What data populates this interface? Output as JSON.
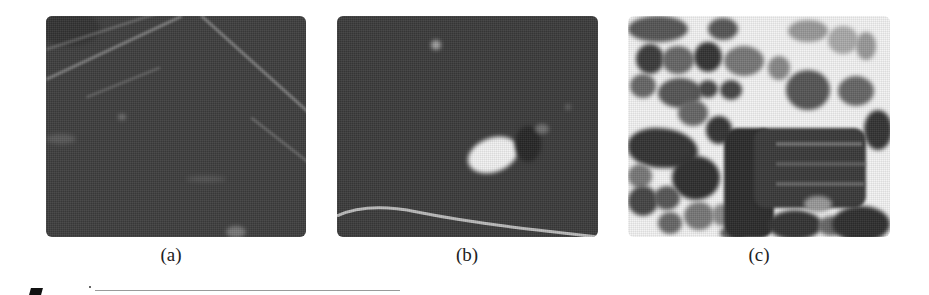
{
  "figure": {
    "panels": [
      {
        "id": "a",
        "caption": "(a)",
        "description": "Dark grayscale image with faint diagonal light streaks"
      },
      {
        "id": "b",
        "caption": "(b)",
        "description": "Dark grayscale image with a bright white blob near center and a light curved line along the bottom"
      },
      {
        "id": "c",
        "caption": "(c)",
        "description": "Light background with many dark rounded blobs and a large dark rectangular structure"
      }
    ]
  }
}
